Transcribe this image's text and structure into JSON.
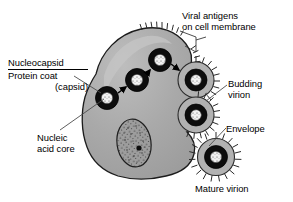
{
  "figure": {
    "type": "biology-diagram",
    "background_color": "#ffffff",
    "text_color": "#000000",
    "palette": {
      "cytoplasm_fill": "#a8a8a8",
      "cytoplasm_stroke": "#1a1a1a",
      "cell_highlight": "#c9c9c9",
      "nucleus_fill": "#9a9a9a",
      "nucleus_stroke": "#1a1a1a",
      "nucleolus_fill": "#101010",
      "capsid_fill": "#0d0d0d",
      "core_fill": "#f2f2f2",
      "envelope_fill": "#b5b5b5",
      "envelope_stroke": "#2b2b2b",
      "spike_color": "#2b2b2b",
      "leader_line_color": "#555555",
      "arrow_color": "#000000"
    }
  },
  "labels": {
    "viral_antigens": {
      "line1": "Viral antigens",
      "line2": "on cell membrane"
    },
    "nucleocapsid": {
      "heading": "Nucleocapsid",
      "line1": "Protein coat",
      "line2": "(capsid)"
    },
    "nucleic_acid_core": {
      "line1": "Nucleic",
      "line2": "acid core"
    },
    "budding_virion": {
      "line1": "Budding",
      "line2": "virion"
    },
    "envelope": {
      "line1": "Envelope"
    },
    "mature_virion": {
      "line1": "Mature virion"
    }
  },
  "structures": {
    "cell": "host cell",
    "nucleus": "cell nucleus",
    "nucleolus": "nucleolus",
    "nucleocapsids_in_cytoplasm": 4,
    "budding_virions": 2,
    "mature_virions": 1,
    "migration_arrows": 3,
    "antigen_spike_patches": 4
  }
}
